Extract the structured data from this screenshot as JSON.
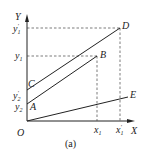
{
  "figure": {
    "caption": "(a)",
    "axes": {
      "x_label": "X",
      "y_label": "Y",
      "origin_label": "O"
    },
    "points": {
      "A": "A",
      "B": "B",
      "C": "C",
      "D": "D",
      "E": "E"
    },
    "y_ticks": {
      "y1_prime": {
        "base": "y",
        "sub": "1",
        "prime": "′"
      },
      "y1": {
        "base": "y",
        "sub": "1"
      },
      "y2_prime": {
        "base": "y",
        "sub": "2",
        "prime": "′"
      },
      "y2": {
        "base": "y",
        "sub": "2"
      }
    },
    "x_ticks": {
      "x1": {
        "base": "x",
        "sub": "1"
      },
      "x1_prime": {
        "base": "x",
        "sub": "1",
        "prime": "′"
      }
    },
    "lines": [
      {
        "name": "A-B",
        "from": "A",
        "to": "B"
      },
      {
        "name": "C-D",
        "from": "C",
        "to": "D"
      },
      {
        "name": "O-E",
        "from": "O",
        "to": "E"
      }
    ],
    "colors": {
      "stroke": "#222222",
      "background": "#ffffff"
    }
  }
}
